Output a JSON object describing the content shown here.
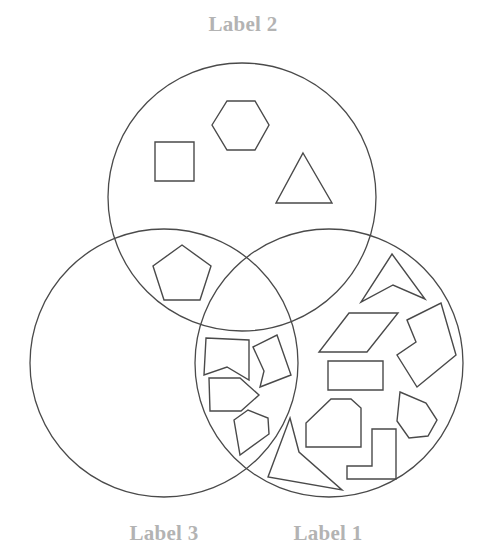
{
  "diagram": {
    "type": "venn",
    "sets": [
      {
        "id": "set-1",
        "label": "Label 1",
        "label_pos": [
          328,
          521
        ],
        "circle": {
          "cx": 329,
          "cy": 363,
          "r": 134
        }
      },
      {
        "id": "set-2",
        "label": "Label 2",
        "label_pos": [
          243,
          12
        ],
        "circle": {
          "cx": 242,
          "cy": 197,
          "r": 134
        }
      },
      {
        "id": "set-3",
        "label": "Label 3",
        "label_pos": [
          164,
          521
        ],
        "circle": {
          "cx": 164,
          "cy": 363,
          "r": 134
        }
      }
    ],
    "colors": {
      "label": "#b3b3b3",
      "stroke": "#4a4a4a",
      "background": "#ffffff"
    },
    "shapes": [
      {
        "name": "square",
        "region": "Label 2 only",
        "points": "155,142 194,142 194,181 155,181"
      },
      {
        "name": "hexagon",
        "region": "Label 2 only",
        "points": "212,125 227,101 255,101 269,125 255,150 227,150"
      },
      {
        "name": "triangle",
        "region": "Label 2 only",
        "points": "303,153 332,203 276,203"
      },
      {
        "name": "pentagon",
        "region": "Label 2 and Label 3",
        "points": "182,245 211,266 200,300 164,300 153,266"
      },
      {
        "name": "notched-rectangle",
        "region": "Label 1 and Label 3",
        "points": "206,338 249,340 249,380 227,367 204,375"
      },
      {
        "name": "notched-quadrilateral",
        "region": "Label 1 and Label 3",
        "points": "253,347 277,335 291,375 260,387 264,371"
      },
      {
        "name": "arrow-pentagon",
        "region": "Label 1 and Label 3",
        "points": "209,378 240,378 259,395 241,411 210,411"
      },
      {
        "name": "irregular-pentagon",
        "region": "Label 1 and Label 3",
        "points": "234,420 248,410 268,418 269,434 240,455"
      },
      {
        "name": "concave-triangle",
        "region": "Label 1 and Label 3 boundary",
        "points": "290,418 299,452 342,490 268,477"
      },
      {
        "name": "arrowhead",
        "region": "Label 1 only",
        "points": "392,254 425,299 393,285 361,302"
      },
      {
        "name": "parallelogram",
        "region": "Label 1 only",
        "points": "349,313 398,313 367,352 319,352"
      },
      {
        "name": "notched-square",
        "region": "Label 1 only",
        "points": "407,320 441,303 456,355 417,387 397,355 416,342"
      },
      {
        "name": "rectangle",
        "region": "Label 1 only",
        "points": "328,361 383,361 383,390 328,390"
      },
      {
        "name": "octagon-cut",
        "region": "Label 1 only",
        "points": "331,399 351,399 361,408 361,447 306,447 306,423"
      },
      {
        "name": "irregular-hexagon",
        "region": "Label 1 only",
        "points": "400,392 426,403 437,420 428,436 409,438 397,421"
      },
      {
        "name": "l-shape",
        "region": "Label 1 only",
        "points": "372,429 396,429 396,479 347,479 347,466 372,466"
      }
    ]
  }
}
